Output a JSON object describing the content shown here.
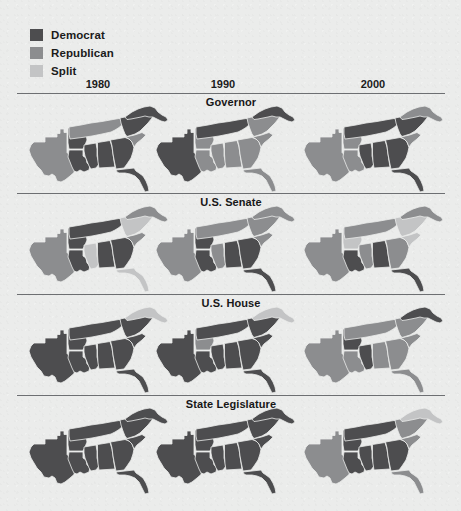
{
  "figure": {
    "background_color": "#ebeceb",
    "rule_color": "#6d6f72"
  },
  "legend": {
    "title": "",
    "items": [
      {
        "label": "Democrat",
        "key": "democrat",
        "color": "#4d4d4f"
      },
      {
        "label": "Republican",
        "key": "republican",
        "color": "#8c8d8f"
      },
      {
        "label": "Split",
        "key": "split",
        "color": "#c3c4c5"
      }
    ]
  },
  "columns": [
    {
      "label": "1980",
      "year": 1980,
      "center_x": 81
    },
    {
      "label": "1990",
      "year": 1990,
      "center_x": 206
    },
    {
      "label": "2000",
      "year": 2000,
      "center_x": 356
    }
  ],
  "chart_data": {
    "type": "map",
    "title": "",
    "subtitle": "",
    "region": "U.S. South",
    "legend_position": "top-left",
    "categories": [
      "Democrat",
      "Republican",
      "Split"
    ],
    "category_colors": {
      "democrat": "#4d4d4f",
      "republican": "#8c8d8f",
      "split": "#c3c4c5"
    },
    "x": [
      "1980",
      "1990",
      "2000"
    ],
    "states": [
      {
        "id": "TX",
        "name": "Texas"
      },
      {
        "id": "AR",
        "name": "Arkansas"
      },
      {
        "id": "LA",
        "name": "Louisiana"
      },
      {
        "id": "MS",
        "name": "Mississippi"
      },
      {
        "id": "AL",
        "name": "Alabama"
      },
      {
        "id": "TN",
        "name": "Tennessee"
      },
      {
        "id": "GA",
        "name": "Georgia"
      },
      {
        "id": "FL",
        "name": "Florida"
      },
      {
        "id": "SC",
        "name": "South Carolina"
      },
      {
        "id": "NC",
        "name": "North Carolina"
      },
      {
        "id": "VA",
        "name": "Virginia"
      }
    ],
    "panels": [
      {
        "label": "Governor",
        "row": 0,
        "maps": [
          {
            "year": "1980",
            "values": {
              "TX": "republican",
              "AR": "democrat",
              "LA": "democrat",
              "MS": "democrat",
              "AL": "democrat",
              "TN": "republican",
              "GA": "democrat",
              "FL": "democrat",
              "SC": "republican",
              "NC": "democrat",
              "VA": "democrat"
            }
          },
          {
            "year": "1990",
            "values": {
              "TX": "democrat",
              "AR": "republican",
              "LA": "republican",
              "MS": "republican",
              "AL": "republican",
              "TN": "democrat",
              "GA": "republican",
              "FL": "republican",
              "SC": "republican",
              "NC": "republican",
              "VA": "democrat"
            }
          },
          {
            "year": "2000",
            "values": {
              "TX": "republican",
              "AR": "republican",
              "LA": "republican",
              "MS": "democrat",
              "AL": "democrat",
              "TN": "democrat",
              "GA": "democrat",
              "FL": "democrat",
              "SC": "republican",
              "NC": "democrat",
              "VA": "republican"
            }
          }
        ]
      },
      {
        "label": "U.S. Senate",
        "row": 1,
        "maps": [
          {
            "year": "1980",
            "values": {
              "TX": "republican",
              "AR": "democrat",
              "LA": "democrat",
              "MS": "split",
              "AL": "democrat",
              "TN": "democrat",
              "GA": "democrat",
              "FL": "split",
              "SC": "republican",
              "NC": "split",
              "VA": "republican"
            }
          },
          {
            "year": "1990",
            "values": {
              "TX": "republican",
              "AR": "democrat",
              "LA": "democrat",
              "MS": "republican",
              "AL": "democrat",
              "TN": "republican",
              "GA": "democrat",
              "FL": "democrat",
              "SC": "republican",
              "NC": "republican",
              "VA": "republican"
            }
          },
          {
            "year": "2000",
            "values": {
              "TX": "republican",
              "AR": "split",
              "LA": "democrat",
              "MS": "republican",
              "AL": "democrat",
              "TN": "republican",
              "GA": "republican",
              "FL": "democrat",
              "SC": "split",
              "NC": "split",
              "VA": "republican"
            }
          }
        ]
      },
      {
        "label": "U.S. House",
        "row": 2,
        "maps": [
          {
            "year": "1980",
            "values": {
              "TX": "democrat",
              "AR": "democrat",
              "LA": "democrat",
              "MS": "democrat",
              "AL": "democrat",
              "TN": "democrat",
              "GA": "democrat",
              "FL": "democrat",
              "SC": "democrat",
              "NC": "democrat",
              "VA": "split"
            }
          },
          {
            "year": "1990",
            "values": {
              "TX": "democrat",
              "AR": "republican",
              "LA": "democrat",
              "MS": "democrat",
              "AL": "democrat",
              "TN": "democrat",
              "GA": "democrat",
              "FL": "democrat",
              "SC": "democrat",
              "NC": "democrat",
              "VA": "split"
            }
          },
          {
            "year": "2000",
            "values": {
              "TX": "republican",
              "AR": "democrat",
              "LA": "republican",
              "MS": "democrat",
              "AL": "republican",
              "TN": "republican",
              "GA": "republican",
              "FL": "republican",
              "SC": "republican",
              "NC": "republican",
              "VA": "democrat"
            }
          }
        ]
      },
      {
        "label": "State Legislature",
        "row": 3,
        "maps": [
          {
            "year": "1980",
            "values": {
              "TX": "democrat",
              "AR": "democrat",
              "LA": "democrat",
              "MS": "democrat",
              "AL": "democrat",
              "TN": "democrat",
              "GA": "democrat",
              "FL": "democrat",
              "SC": "democrat",
              "NC": "democrat",
              "VA": "democrat"
            }
          },
          {
            "year": "1990",
            "values": {
              "TX": "democrat",
              "AR": "democrat",
              "LA": "democrat",
              "MS": "democrat",
              "AL": "democrat",
              "TN": "democrat",
              "GA": "democrat",
              "FL": "democrat",
              "SC": "democrat",
              "NC": "democrat",
              "VA": "democrat"
            }
          },
          {
            "year": "2000",
            "values": {
              "TX": "republican",
              "AR": "democrat",
              "LA": "democrat",
              "MS": "democrat",
              "AL": "democrat",
              "TN": "democrat",
              "GA": "democrat",
              "FL": "republican",
              "SC": "republican",
              "NC": "republican",
              "VA": "split"
            }
          }
        ]
      }
    ]
  }
}
